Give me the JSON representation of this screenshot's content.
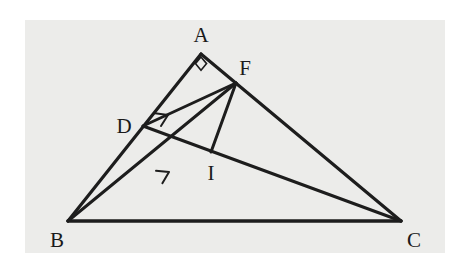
{
  "figure": {
    "background_color": "#ffffff",
    "panel_color": "#ececea",
    "line_color": "#1d1d1d",
    "label_color": "#1a1a1a",
    "panel": {
      "x": 25,
      "y": 20,
      "width": 420,
      "height": 233
    },
    "points": [
      {
        "name": "A",
        "label": "A",
        "x": 201,
        "y": 54,
        "label_x": 201,
        "label_y": 42
      },
      {
        "name": "B",
        "label": "B",
        "x": 68,
        "y": 221,
        "label_x": 57,
        "label_y": 247
      },
      {
        "name": "C",
        "label": "C",
        "x": 401,
        "y": 221,
        "label_x": 414,
        "label_y": 247
      },
      {
        "name": "D",
        "label": "D",
        "x": 143,
        "y": 126,
        "label_x": 124,
        "label_y": 133
      },
      {
        "name": "F",
        "label": "F",
        "x": 236,
        "y": 83,
        "label_x": 245,
        "label_y": 75
      },
      {
        "name": "I",
        "label": "I",
        "x": 211,
        "y": 152,
        "label_x": 211,
        "label_y": 180
      }
    ],
    "segments": [
      {
        "name": "side-AB",
        "from": "A",
        "to": "B",
        "width": 3.2
      },
      {
        "name": "side-AC",
        "from": "A",
        "to": "C",
        "width": 3.2
      },
      {
        "name": "side-BC",
        "from": "B",
        "to": "C",
        "width": 3.6
      },
      {
        "name": "cevian-DC",
        "from": "D",
        "to": "C",
        "width": 3.0
      },
      {
        "name": "cevian-BF",
        "from": "B",
        "to": "F",
        "width": 3.0
      },
      {
        "name": "segment-DF",
        "from": "D",
        "to": "F",
        "width": 3.0
      },
      {
        "name": "segment-FI",
        "from": "F",
        "to": "I",
        "width": 3.0
      }
    ],
    "arrow_marks": [
      {
        "name": "parallel-mark-DF",
        "x": 168,
        "y": 115,
        "angle": -25
      },
      {
        "name": "parallel-mark-BF",
        "x": 169,
        "y": 172,
        "angle": -27
      }
    ],
    "right_angle": {
      "name": "right-angle-at-A",
      "x": 201,
      "y": 62,
      "size": 9
    }
  }
}
